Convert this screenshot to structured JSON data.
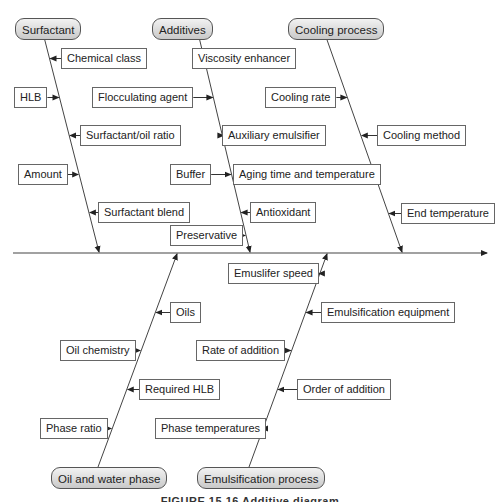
{
  "diagram": {
    "type": "fishbone",
    "spine": "main-effect-arrow",
    "categories": [
      {
        "id": "surfactant",
        "label": "Surfactant",
        "position": "top",
        "causes": [
          {
            "label": "Chemical class",
            "side": "right"
          },
          {
            "label": "HLB",
            "side": "left"
          },
          {
            "label": "Surfactant/oil ratio",
            "side": "right"
          },
          {
            "label": "Amount",
            "side": "left"
          },
          {
            "label": "Surfactant blend",
            "side": "right"
          }
        ]
      },
      {
        "id": "additives",
        "label": "Additives",
        "position": "top",
        "causes": [
          {
            "label": "Viscosity enhancer",
            "side": "right"
          },
          {
            "label": "Flocculating agent",
            "side": "left"
          },
          {
            "label": "Auxiliary emulsifier",
            "side": "right"
          },
          {
            "label": "Buffer",
            "side": "left"
          },
          {
            "label": "Antioxidant",
            "side": "right"
          },
          {
            "label": "Preservative",
            "side": "left"
          }
        ]
      },
      {
        "id": "cooling",
        "label": "Cooling process",
        "position": "top",
        "causes": [
          {
            "label": "Cooling rate",
            "side": "left"
          },
          {
            "label": "Cooling method",
            "side": "right"
          },
          {
            "label": "Aging time and temperature",
            "side": "left"
          },
          {
            "label": "End temperature",
            "side": "right"
          }
        ]
      },
      {
        "id": "oilwater",
        "label": "Oil and water phase",
        "position": "bottom",
        "causes": [
          {
            "label": "Oils",
            "side": "right"
          },
          {
            "label": "Oil chemistry",
            "side": "left"
          },
          {
            "label": "Required HLB",
            "side": "right"
          },
          {
            "label": "Phase ratio",
            "side": "left"
          }
        ]
      },
      {
        "id": "emulsification",
        "label": "Emulsification process",
        "position": "bottom",
        "causes": [
          {
            "label": "Emuslifer speed",
            "side": "left"
          },
          {
            "label": "Emulsification equipment",
            "side": "right"
          },
          {
            "label": "Rate of addition",
            "side": "left"
          },
          {
            "label": "Order of addition",
            "side": "right"
          },
          {
            "label": "Phase temperatures",
            "side": "left"
          }
        ]
      }
    ]
  },
  "caption": "FIGURE 15.16 Additive diagram"
}
